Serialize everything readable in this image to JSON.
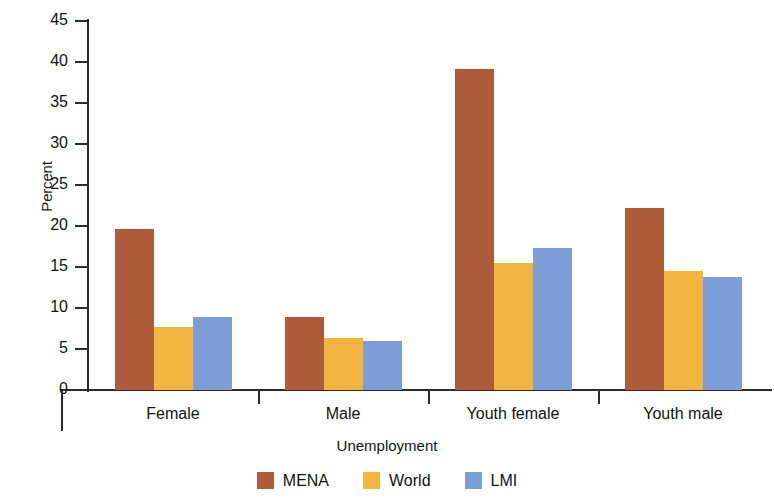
{
  "chart_data": {
    "type": "bar",
    "title": "",
    "xlabel": "Unemployment",
    "ylabel": "Percent",
    "categories": [
      "Female",
      "Male",
      "Youth female",
      "Youth male"
    ],
    "series": [
      {
        "name": "MENA",
        "color": "#AD5B39",
        "values": [
          19.6,
          8.9,
          39.1,
          22.2
        ]
      },
      {
        "name": "World",
        "color": "#F2B43D",
        "values": [
          7.7,
          6.3,
          15.5,
          14.5
        ]
      },
      {
        "name": "LMI",
        "color": "#7D9DD8",
        "values": [
          8.9,
          6.0,
          17.3,
          13.8
        ]
      }
    ],
    "ylim": [
      0,
      45
    ],
    "ytick_labels": [
      "0",
      "5",
      "10",
      "15",
      "20",
      "25",
      "30",
      "35",
      "40",
      "45"
    ],
    "ytick_values": [
      0,
      5,
      10,
      15,
      20,
      25,
      30,
      35,
      40,
      45
    ],
    "grid": false,
    "legend_position": "bottom"
  }
}
